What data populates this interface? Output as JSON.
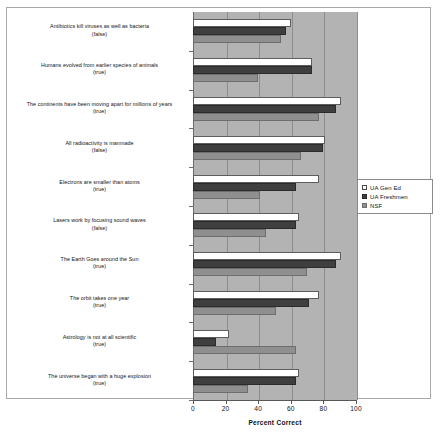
{
  "chart_data": {
    "type": "bar",
    "orientation": "horizontal",
    "title": "",
    "xlabel": "Percent Correct",
    "ylabel": "",
    "xlim": [
      0,
      100
    ],
    "xticks": [
      0,
      20,
      40,
      60,
      80,
      100
    ],
    "grid": true,
    "legend_position": "right",
    "legend": [
      "UA Gen Ed",
      "UA Freshmen",
      "NSF"
    ],
    "colors": {
      "UA Gen Ed": "#ffffff",
      "UA Freshmen": "#3f3f3f",
      "NSF": "#8f8f8f",
      "plot_background": "#b3b3b3"
    },
    "categories": [
      "Antibiotics kill viruses as well as bacteria",
      "Humans evolved from earlier species of animals",
      "The continents have been moving apart for millions of years",
      "All radioactivity is manmade",
      "Electrons are smaller than atoms",
      "Lasers work by focusing sound waves",
      "The Earth Goes around the Sun",
      "The orbit takes one year",
      "Astrology is not at all scientific",
      "The universe began with a huge explosion"
    ],
    "category_truth": [
      "(false)",
      "(true)",
      "(true)",
      "(false)",
      "(true)",
      "(false)",
      "(true)",
      "(true)",
      "(true)",
      "(true)"
    ],
    "series": [
      {
        "name": "UA Gen Ed",
        "values": [
          60,
          73,
          91,
          81,
          77,
          65,
          91,
          77,
          22,
          65
        ]
      },
      {
        "name": "UA Freshmen",
        "values": [
          57,
          73,
          88,
          80,
          63,
          63,
          88,
          71,
          14,
          63
        ]
      },
      {
        "name": "NSF",
        "values": [
          54,
          40,
          77,
          66,
          41,
          45,
          70,
          51,
          63,
          34
        ]
      }
    ]
  },
  "labels": {
    "rows": [
      {
        "question": "Antibiotics kill viruses as well as bacteria",
        "truth": "(false)"
      },
      {
        "question": "Humans evolved from earlier species of animals",
        "truth": "(true)"
      },
      {
        "question": "The continents have been moving apart for millions of years",
        "truth": "(true)"
      },
      {
        "question": "All radioactivity is manmade",
        "truth": "(false)"
      },
      {
        "question": "Electrons are smaller than atoms",
        "truth": "(true)"
      },
      {
        "question": "Lasers work by focusing sound waves",
        "truth": "(false)"
      },
      {
        "question": "The Earth Goes around the Sun",
        "truth": "(true)"
      },
      {
        "question": "The orbit takes one year",
        "truth": "(true)"
      },
      {
        "question": "Astrology is not at all scientific",
        "truth": "(true)"
      },
      {
        "question": "The universe began with a huge explosion",
        "truth": "(true)"
      }
    ]
  },
  "axis": {
    "tick_labels": [
      "0",
      "20",
      "40",
      "60",
      "80",
      "100"
    ],
    "title": "Percent Correct"
  },
  "legend": {
    "entries": [
      {
        "label": "UA Gen Ed",
        "swatch": "open-square-icon"
      },
      {
        "label": "UA Freshmen",
        "swatch": "filled-dark-square-icon"
      },
      {
        "label": "NSF",
        "swatch": "filled-grey-square-icon"
      }
    ]
  }
}
